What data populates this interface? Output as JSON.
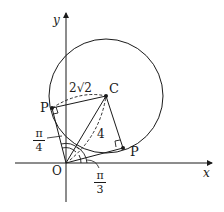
{
  "diagram": {
    "axes": {
      "x_label": "x",
      "y_label": "y",
      "origin_label": "O"
    },
    "points": {
      "center": "C",
      "tangent_point_upper": "P",
      "tangent_point_lower": "P"
    },
    "labels": {
      "radius": "2√2",
      "radius_coeff": "2",
      "radius_root": "2",
      "distance_OC": "4"
    },
    "angles": {
      "upper": {
        "num": "π",
        "den": "4"
      },
      "lower": {
        "num": "π",
        "den": "3"
      }
    },
    "colors": {
      "stroke": "#1a1a1a",
      "background": "#ffffff"
    }
  }
}
